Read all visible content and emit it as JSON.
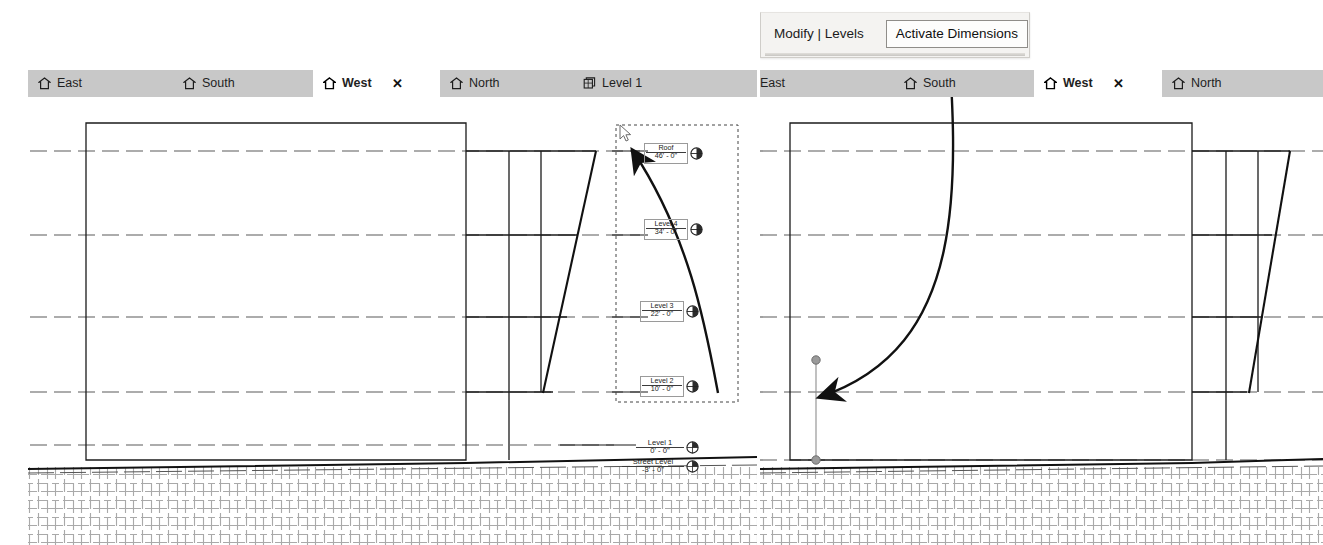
{
  "app": {
    "ghost_text": " "
  },
  "ribbon": {
    "context_label": "Modify | Levels",
    "activate_dimensions_label": "Activate Dimensions"
  },
  "left_panel": {
    "tabs": [
      {
        "label": "East",
        "icon": "elevation-icon",
        "active": false,
        "closable": false
      },
      {
        "label": "South",
        "icon": "elevation-icon",
        "active": false,
        "closable": false
      },
      {
        "label": "West",
        "icon": "elevation-icon",
        "active": true,
        "closable": true
      },
      {
        "label": "North",
        "icon": "elevation-icon",
        "active": false,
        "closable": false
      },
      {
        "label": "Level 1",
        "icon": "floor-plan-icon",
        "active": false,
        "closable": false
      }
    ],
    "close_glyph": "✕",
    "annotation": "Select the upper levels",
    "levels": [
      {
        "name": "Roof",
        "elevation": "46' - 0\"",
        "boxed": true,
        "selected": true
      },
      {
        "name": "Level 4",
        "elevation": "34' - 0\"",
        "boxed": true,
        "selected": true
      },
      {
        "name": "Level 3",
        "elevation": "22' - 0\"",
        "boxed": true,
        "selected": true
      },
      {
        "name": "Level 2",
        "elevation": "10' - 0\"",
        "boxed": true,
        "selected": true
      },
      {
        "name": "Level 1",
        "elevation": "0' - 0\"",
        "boxed": false,
        "selected": false
      },
      {
        "name": "Street Level",
        "elevation": "-3' - 0\"",
        "boxed": false,
        "selected": false
      }
    ]
  },
  "right_panel": {
    "tabs": [
      {
        "label": "East",
        "icon": "none",
        "active": false,
        "closable": false
      },
      {
        "label": "South",
        "icon": "elevation-icon",
        "active": false,
        "closable": false
      },
      {
        "label": "West",
        "icon": "elevation-icon",
        "active": true,
        "closable": true
      },
      {
        "label": "North",
        "icon": "elevation-icon",
        "active": false,
        "closable": false
      }
    ],
    "close_glyph": "✕",
    "dimension_input_value": "12"
  },
  "colors": {
    "tabbar_bg": "#c8c8c8",
    "tab_active_bg": "#ffffff",
    "ribbon_bg": "#f4f3f1",
    "line": "#1b1b1b",
    "grid_dash": "#6b6b6b",
    "grip": "#8d8d8d",
    "selection_box": "#555555"
  }
}
